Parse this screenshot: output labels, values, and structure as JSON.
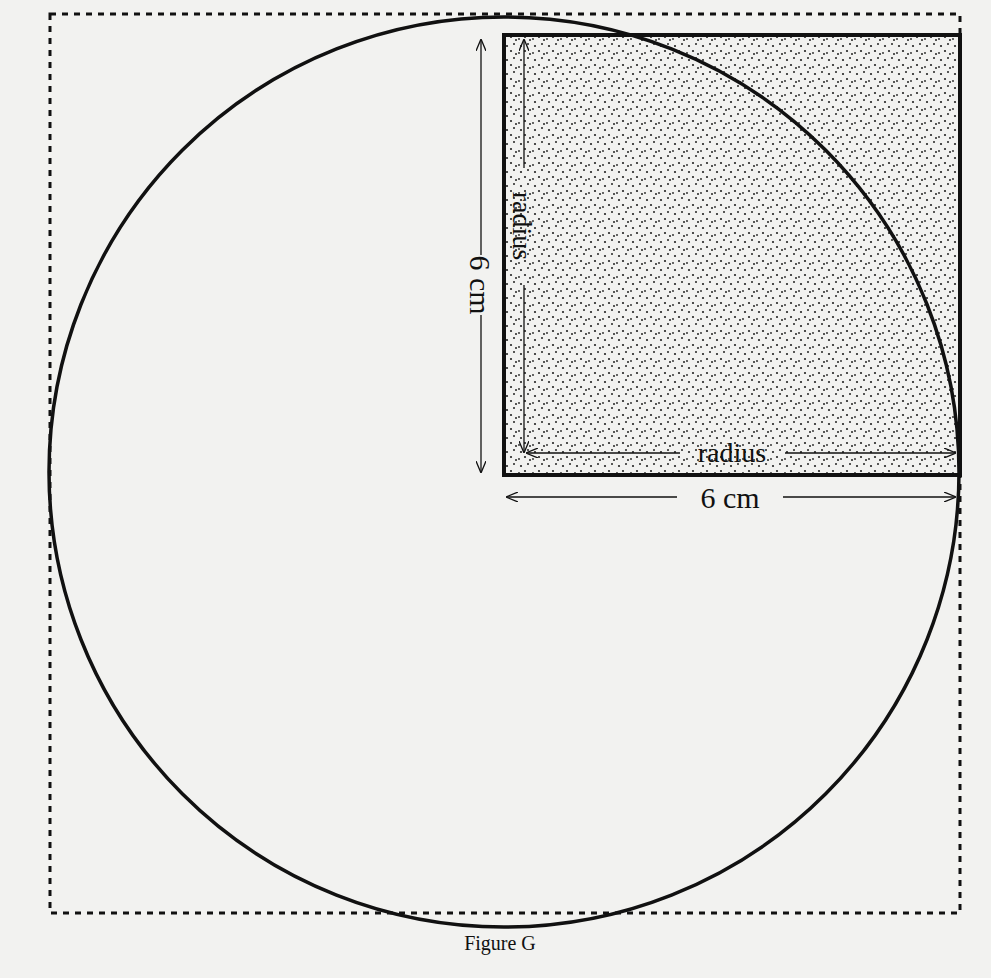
{
  "figure": {
    "caption": "Figure G",
    "labels": {
      "vertical_outer": "6 cm",
      "vertical_inner": "radius",
      "horizontal_inner": "radius",
      "horizontal_outer": "6 cm"
    },
    "colors": {
      "background": "#f2f2f0",
      "ink": "#111111",
      "shade_dots": "#222222"
    },
    "geometry": {
      "circle": {
        "cx": 504,
        "cy": 472,
        "r": 455
      },
      "dashed_square": {
        "x": 50,
        "y": 14,
        "w": 910,
        "h": 899
      },
      "shaded_square": {
        "x": 504,
        "y": 35,
        "w": 456,
        "h": 440
      }
    }
  }
}
